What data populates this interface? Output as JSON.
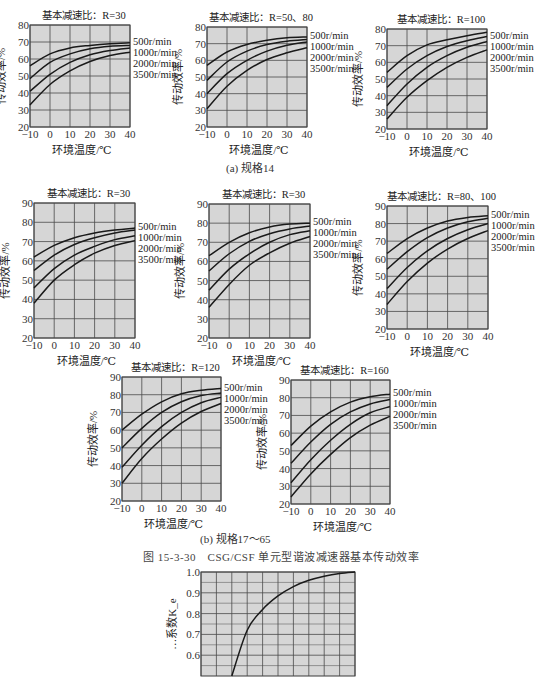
{
  "captions": {
    "a": "(a) 规格14",
    "b": "(b) 规格17～65",
    "figure": "图 15-3-30　CSG/CSF 单元型谐波减速器基本传动效率"
  },
  "chart_data": [
    {
      "id": "a1",
      "type": "line",
      "title": "基本减速比：R=30",
      "xlabel": "环境温度/℃",
      "ylabel": "传动效率/%",
      "x": [
        -10,
        0,
        10,
        20,
        30,
        40
      ],
      "xlim": [
        -10,
        40
      ],
      "ylim": [
        20,
        80
      ],
      "yticks": [
        20,
        30,
        40,
        50,
        60,
        70,
        80
      ],
      "xticks": [
        -10,
        0,
        10,
        20,
        30,
        40
      ],
      "grid": true,
      "legend_position": "right",
      "series": [
        {
          "name": "500r/min",
          "values": [
            56,
            63,
            66.5,
            68,
            69,
            69.5
          ]
        },
        {
          "name": "1000r/min",
          "values": [
            48.5,
            58,
            63,
            66,
            67.5,
            68
          ]
        },
        {
          "name": "2000r/min",
          "values": [
            41,
            51,
            58,
            62.5,
            65,
            66.5
          ]
        },
        {
          "name": "3500r/min",
          "values": [
            33,
            45,
            53,
            58.5,
            62,
            64
          ]
        }
      ],
      "box": {
        "left": 30,
        "top": 25,
        "width": 100,
        "height": 102
      }
    },
    {
      "id": "a2",
      "type": "line",
      "title": "基本减速比：R=50、80",
      "xlabel": "环境温度/℃",
      "ylabel": "传动效率/%",
      "x": [
        -10,
        0,
        10,
        20,
        30,
        40
      ],
      "xlim": [
        -10,
        40
      ],
      "ylim": [
        20,
        80
      ],
      "yticks": [
        20,
        30,
        40,
        50,
        60,
        70,
        80
      ],
      "xticks": [
        -10,
        0,
        10,
        20,
        30,
        40
      ],
      "grid": true,
      "legend_position": "right",
      "series": [
        {
          "name": "500r/min",
          "values": [
            57,
            65,
            69.5,
            72,
            73.5,
            74
          ]
        },
        {
          "name": "1000r/min",
          "values": [
            48,
            59,
            65.5,
            69.5,
            71.5,
            72.5
          ]
        },
        {
          "name": "2000r/min",
          "values": [
            40,
            52,
            60,
            65.5,
            69,
            71
          ]
        },
        {
          "name": "3500r/min",
          "values": [
            31,
            44.5,
            54,
            60.5,
            64.5,
            67.5
          ]
        }
      ],
      "box": {
        "left": 207,
        "top": 27,
        "width": 100,
        "height": 100
      }
    },
    {
      "id": "a3",
      "type": "line",
      "title": "基本减速比：R=100",
      "xlabel": "环境温度/℃",
      "ylabel": "传动效率/%",
      "x": [
        -10,
        0,
        10,
        20,
        30,
        40
      ],
      "xlim": [
        -10,
        40
      ],
      "ylim": [
        20,
        80
      ],
      "yticks": [
        20,
        30,
        40,
        50,
        60,
        70,
        80
      ],
      "xticks": [
        -10,
        0,
        10,
        20,
        30,
        40
      ],
      "grid": true,
      "legend_position": "right",
      "series": [
        {
          "name": "500r/min",
          "values": [
            54,
            64,
            70.5,
            73.5,
            76,
            78
          ]
        },
        {
          "name": "1000r/min",
          "values": [
            45,
            56,
            64,
            69.5,
            73,
            75.5
          ]
        },
        {
          "name": "2000r/min",
          "values": [
            34,
            47,
            57,
            64,
            69,
            72.5
          ]
        },
        {
          "name": "3500r/min",
          "values": [
            26,
            39,
            49,
            57,
            63,
            67.5
          ]
        }
      ],
      "box": {
        "left": 387,
        "top": 29,
        "width": 100,
        "height": 100
      }
    },
    {
      "id": "b1",
      "type": "line",
      "title": "基本减速比：R=30",
      "xlabel": "环境温度/℃",
      "ylabel": "传动效率/%",
      "x": [
        -10,
        0,
        10,
        20,
        30,
        40
      ],
      "xlim": [
        -10,
        40
      ],
      "ylim": [
        20,
        90
      ],
      "yticks": [
        20,
        30,
        40,
        50,
        60,
        70,
        80,
        90
      ],
      "xticks": [
        -10,
        0,
        10,
        20,
        30,
        40
      ],
      "grid": true,
      "legend_position": "right",
      "series": [
        {
          "name": "500r/min",
          "values": [
            62,
            68,
            72,
            74.5,
            76,
            77
          ]
        },
        {
          "name": "1000r/min",
          "values": [
            55,
            63,
            68.5,
            72,
            74.5,
            76
          ]
        },
        {
          "name": "2000r/min",
          "values": [
            46,
            56,
            63,
            67.5,
            71,
            73
          ]
        },
        {
          "name": "3500r/min",
          "values": [
            38,
            50,
            58,
            64,
            68,
            70.5
          ]
        }
      ],
      "box": {
        "left": 34,
        "top": 203,
        "width": 101,
        "height": 135
      }
    },
    {
      "id": "b2",
      "type": "line",
      "title": "基本减速比：R=30",
      "xlabel": "环境温度/℃",
      "ylabel": "传动效率/%",
      "x": [
        -10,
        0,
        10,
        20,
        30,
        40
      ],
      "xlim": [
        -10,
        40
      ],
      "ylim": [
        20,
        90
      ],
      "yticks": [
        20,
        30,
        40,
        50,
        60,
        70,
        80,
        90
      ],
      "xticks": [
        -10,
        0,
        10,
        20,
        30,
        40
      ],
      "grid": true,
      "legend_position": "right",
      "series": [
        {
          "name": "500r/min",
          "values": [
            63,
            70,
            75,
            78,
            79.5,
            80
          ]
        },
        {
          "name": "1000r/min",
          "values": [
            55,
            64,
            70.5,
            74.5,
            77,
            78.5
          ]
        },
        {
          "name": "2000r/min",
          "values": [
            45,
            56,
            64,
            70,
            74,
            76
          ]
        },
        {
          "name": "3500r/min",
          "values": [
            36,
            48,
            58,
            64.5,
            69.5,
            73
          ]
        }
      ],
      "box": {
        "left": 209,
        "top": 204,
        "width": 101,
        "height": 134
      }
    },
    {
      "id": "b3",
      "type": "line",
      "title": "基本减速比：R=80、100",
      "xlabel": "环境温度/℃",
      "ylabel": "传动效率/%",
      "x": [
        -10,
        0,
        10,
        20,
        30,
        40
      ],
      "xlim": [
        -10,
        40
      ],
      "ylim": [
        20,
        90
      ],
      "yticks": [
        20,
        30,
        40,
        50,
        60,
        70,
        80,
        90
      ],
      "xticks": [
        -10,
        0,
        10,
        20,
        30,
        40
      ],
      "grid": true,
      "legend_position": "right",
      "series": [
        {
          "name": "500r/min",
          "values": [
            63,
            71.5,
            77.5,
            81.5,
            83.5,
            84.5
          ]
        },
        {
          "name": "1000r/min",
          "values": [
            54,
            64,
            72,
            77.5,
            81,
            83
          ]
        },
        {
          "name": "2000r/min",
          "values": [
            43,
            55,
            64.5,
            71.5,
            76.5,
            80
          ]
        },
        {
          "name": "3500r/min",
          "values": [
            34,
            47,
            57.5,
            65.5,
            71.5,
            76
          ]
        }
      ],
      "box": {
        "left": 387,
        "top": 206,
        "width": 101,
        "height": 123
      }
    },
    {
      "id": "b4",
      "type": "line",
      "title": "基本减速比：R=120",
      "xlabel": "环境温度/℃",
      "ylabel": "传动效率/%",
      "x": [
        -10,
        0,
        10,
        20,
        30,
        40
      ],
      "xlim": [
        -10,
        40
      ],
      "ylim": [
        20,
        90
      ],
      "yticks": [
        20,
        30,
        40,
        50,
        60,
        70,
        80,
        90
      ],
      "xticks": [
        -10,
        0,
        10,
        20,
        30,
        40
      ],
      "grid": true,
      "legend_position": "right",
      "series": [
        {
          "name": "500r/min",
          "values": [
            60,
            69,
            76,
            80.5,
            82.5,
            83.5
          ]
        },
        {
          "name": "1000r/min",
          "values": [
            50,
            61,
            70,
            76,
            79.5,
            81
          ]
        },
        {
          "name": "2000r/min",
          "values": [
            39,
            51.5,
            62,
            70,
            75.5,
            78.5
          ]
        },
        {
          "name": "3500r/min",
          "values": [
            30,
            44,
            55,
            64,
            70.5,
            75
          ]
        }
      ],
      "box": {
        "left": 122,
        "top": 377,
        "width": 99,
        "height": 124
      }
    },
    {
      "id": "b5",
      "type": "line",
      "title": "基本减速比：R=160",
      "xlabel": "环境温度/℃",
      "ylabel": "传动效率/%",
      "x": [
        -10,
        0,
        10,
        20,
        30,
        40
      ],
      "xlim": [
        -10,
        40
      ],
      "ylim": [
        20,
        90
      ],
      "yticks": [
        20,
        30,
        40,
        50,
        60,
        70,
        80,
        90
      ],
      "xticks": [
        -10,
        0,
        10,
        20,
        30,
        40
      ],
      "grid": true,
      "legend_position": "right",
      "series": [
        {
          "name": "500r/min",
          "values": [
            53,
            64,
            72,
            77.5,
            80.5,
            82
          ]
        },
        {
          "name": "1000r/min",
          "values": [
            43,
            55,
            65,
            72,
            76.5,
            79
          ]
        },
        {
          "name": "2000r/min",
          "values": [
            32,
            45,
            56,
            65,
            71.5,
            75
          ]
        },
        {
          "name": "3500r/min",
          "values": [
            24,
            37,
            48,
            57.5,
            64.5,
            69.5
          ]
        }
      ],
      "box": {
        "left": 291,
        "top": 380,
        "width": 99,
        "height": 124
      }
    },
    {
      "id": "c1",
      "type": "line",
      "title": "",
      "xlabel": "",
      "ylabel": "…系数K_e",
      "x": [
        0,
        1,
        2,
        3,
        4,
        5,
        6,
        7,
        8,
        9,
        10
      ],
      "xlim": [
        0,
        10
      ],
      "ylim": [
        0.5,
        1.0
      ],
      "yticks": [
        0.6,
        0.7,
        0.8,
        0.9,
        1.0
      ],
      "xticks": [],
      "grid": true,
      "legend_position": "none",
      "series": [
        {
          "name": "curve",
          "values": [
            null,
            null,
            0.5,
            0.72,
            0.82,
            0.885,
            0.93,
            0.96,
            0.98,
            0.993,
            1.0
          ]
        }
      ],
      "box": {
        "left": 201,
        "top": 572,
        "width": 154,
        "height": 104
      }
    }
  ]
}
